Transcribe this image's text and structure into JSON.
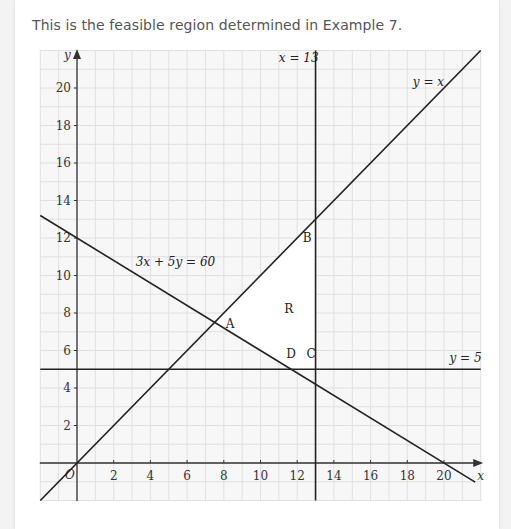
{
  "caption": "This is the feasible region determined in Example 7.",
  "chart_data": {
    "type": "line",
    "xlabel": "x",
    "ylabel": "y",
    "xlim": [
      -2,
      22
    ],
    "ylim": [
      -2,
      22
    ],
    "grid": true,
    "x_ticks": [
      2,
      4,
      6,
      8,
      10,
      12,
      14,
      16,
      18,
      20
    ],
    "y_ticks": [
      2,
      4,
      6,
      8,
      10,
      12,
      14,
      16,
      18,
      20
    ],
    "origin_label": "O",
    "lines": [
      {
        "name": "y = x",
        "points": [
          [
            -2,
            -2
          ],
          [
            22,
            22
          ]
        ],
        "label": "y = x",
        "label_pos": [
          18.3,
          20.1
        ]
      },
      {
        "name": "x = 13",
        "points": [
          [
            13,
            -2
          ],
          [
            13,
            22
          ]
        ],
        "label": "x = 13",
        "label_pos": [
          11.0,
          21.4
        ]
      },
      {
        "name": "y = 5",
        "points": [
          [
            -2,
            5
          ],
          [
            22,
            5
          ]
        ],
        "label": "y = 5",
        "label_pos": [
          20.3,
          5.4
        ]
      },
      {
        "name": "3x + 5y = 60",
        "points": [
          [
            -2,
            13.2
          ],
          [
            21.7,
            -1.02
          ]
        ],
        "label": "3x + 5y = 60",
        "label_pos": [
          3.2,
          10.5
        ]
      }
    ],
    "feasible_region": {
      "label": "R",
      "label_pos": [
        11.3,
        8.0
      ],
      "vertices": [
        [
          7.5,
          7.5
        ],
        [
          13,
          13
        ],
        [
          13,
          5
        ],
        [
          11.67,
          5
        ]
      ]
    },
    "points": [
      {
        "name": "A",
        "x": 7.5,
        "y": 7.5,
        "label_pos": [
          8.1,
          7.2
        ]
      },
      {
        "name": "B",
        "x": 13,
        "y": 13,
        "label_pos": [
          12.3,
          11.8
        ]
      },
      {
        "name": "C",
        "x": 13,
        "y": 5,
        "label_pos": [
          12.5,
          5.6
        ]
      },
      {
        "name": "D",
        "x": 11.67,
        "y": 5,
        "label_pos": [
          11.4,
          5.6
        ]
      }
    ]
  },
  "colors": {
    "line": "#222222",
    "grid": "#e0e0e0",
    "plot_bg": "#f7f7f7",
    "region": "#ffffff"
  }
}
